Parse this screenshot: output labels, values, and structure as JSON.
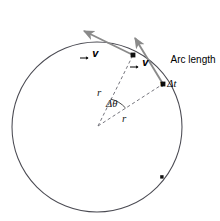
{
  "figure": {
    "background_color": "#ffffff"
  },
  "colors": {
    "circle_stroke": "#4a4a52",
    "vector_arrow": "#8a8a8a",
    "dashed_line": "#6e6e76",
    "point_fill": "#111111",
    "text": "#000000"
  },
  "labels": {
    "velocity_1": "v",
    "velocity_2": "v",
    "radius_1": "r",
    "radius_2": "r",
    "delta_theta": "Δθ",
    "arc_length_line1": "Arc length",
    "arc_length_line2": "v Δt"
  },
  "geometry": {
    "circle": {
      "cx": 97,
      "cy": 127,
      "r": 85
    },
    "center_vertex": {
      "x": 98,
      "y": 126
    },
    "point_1": {
      "x": 133,
      "y": 55
    },
    "point_2": {
      "x": 163,
      "y": 84
    },
    "marker_dot": {
      "x": 162,
      "y": 177
    },
    "arrow_1_tip": {
      "x": 82,
      "y": 29
    },
    "arrow_2_tip": {
      "x": 133,
      "y": 35
    },
    "angle_arc_radius": 30
  },
  "label_positions": {
    "velocity_1": {
      "left": 80,
      "top": 6
    },
    "velocity_2": {
      "left": 130,
      "top": 15
    },
    "radius_1": {
      "left": 97,
      "top": 86
    },
    "radius_2": {
      "left": 122,
      "top": 112
    },
    "delta_theta": {
      "left": 106,
      "top": 98
    },
    "arc_length": {
      "left": 160,
      "top": 43
    }
  }
}
